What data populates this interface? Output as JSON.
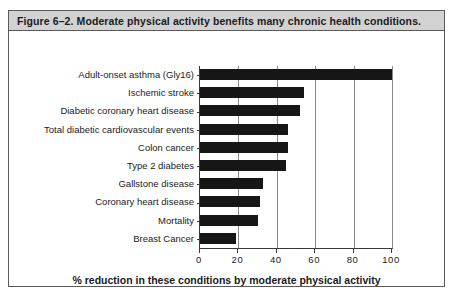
{
  "figure": {
    "caption": "Figure 6–2. Moderate physical activity benefits many chronic health conditions."
  },
  "chart_data": {
    "type": "bar",
    "orientation": "horizontal",
    "title": "Figure 6–2. Moderate physical activity benefits many chronic health conditions.",
    "categories": [
      "Adult-onset asthma (Gly16)",
      "Ischemic stroke",
      "Diabetic coronary heart disease",
      "Total diabetic cardiovascular events",
      "Colon cancer",
      "Type 2 diabetes",
      "Gallstone disease",
      "Coronary heart disease",
      "Mortality",
      "Breast Cancer"
    ],
    "values": [
      100,
      54,
      52,
      46,
      46,
      45,
      33,
      31,
      30,
      19
    ],
    "xlabel": "% reduction in these conditions by moderate physical activity",
    "ylabel": "",
    "xlim": [
      0,
      100
    ],
    "xticks": [
      0,
      20,
      40,
      60,
      80,
      100
    ],
    "xtick_labels": [
      "0",
      "20",
      "40",
      "60",
      "80",
      "100"
    ],
    "grid": true,
    "grid_axis": "x",
    "legend": false,
    "bar_color": "#161616",
    "background": "#ffffff"
  }
}
